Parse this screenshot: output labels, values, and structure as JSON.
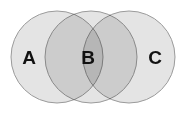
{
  "diagram": {
    "kind": "venn-diagram",
    "background_color": "#ffffff",
    "canvas": {
      "width": 184,
      "height": 116
    },
    "stroke_color": "#9a9a9a",
    "stroke_width": 1,
    "fill_color": "#d4d4d4",
    "fill_opacity": 0.62,
    "label_color": "#111111",
    "regions": [
      {
        "id": "region-a",
        "label": "A",
        "label_x": 29,
        "label_y": 57,
        "shade": "light"
      },
      {
        "id": "region-b",
        "label": "B",
        "label_x": 88,
        "label_y": 57,
        "shade": "dark"
      },
      {
        "id": "region-c",
        "label": "C",
        "label_x": 155,
        "label_y": 57,
        "shade": "lightest"
      }
    ],
    "circles": [
      {
        "id": "circle-left",
        "name": "circle-a",
        "cx": 57,
        "cy": 57,
        "r": 46
      },
      {
        "id": "circle-middle",
        "name": "circle-b",
        "cx": 91,
        "cy": 57,
        "r": 46
      },
      {
        "id": "circle-right",
        "name": "circle-c",
        "cx": 129,
        "cy": 57,
        "r": 46
      }
    ]
  }
}
